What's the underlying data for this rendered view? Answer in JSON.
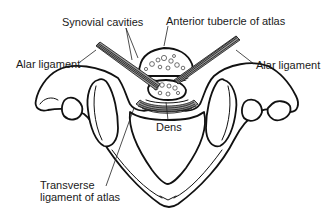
{
  "figure": {
    "background": "#ffffff",
    "line_color": "#111111",
    "labels": {
      "synovial_cavities": "Synovial cavities",
      "anterior_tubercle": "Anterior tubercle of atlas",
      "alar_ligament_left": "Alar ligament",
      "alar_ligament_right": "Alar ligament",
      "dens": "Dens",
      "transverse_ligament_line1": "Transverse",
      "transverse_ligament_line2": "ligament of atlas"
    }
  }
}
